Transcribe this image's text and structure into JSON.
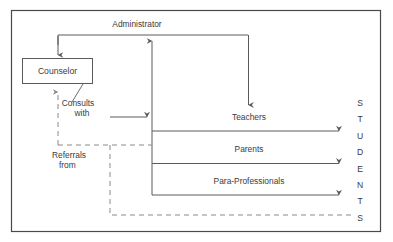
{
  "diagram": {
    "frame": {
      "x": 11,
      "y": 10,
      "width": 370,
      "height": 222,
      "color": "#4a4a4a"
    },
    "colors": {
      "solid_line": "#5a5a5a",
      "dashed_line": "#8a8a8a",
      "text": "#3b3b3b",
      "box_fill": "#ffffff",
      "background": "#ffffff"
    },
    "nodes": [
      {
        "id": "counselor",
        "label": "Counselor",
        "shape": "rectangle",
        "x": 22,
        "y": 58,
        "width": 71,
        "height": 26
      },
      {
        "id": "administrator",
        "label": "Administrator",
        "shape": "text",
        "x": 137,
        "y": 27
      },
      {
        "id": "teachers",
        "label": "Teachers",
        "shape": "text",
        "x": 249,
        "y": 120
      },
      {
        "id": "parents",
        "label": "Parents",
        "shape": "text",
        "x": 249,
        "y": 152
      },
      {
        "id": "para_professionals",
        "label": "Para-Professionals",
        "shape": "text",
        "x": 249,
        "y": 184
      },
      {
        "id": "students",
        "label": "STUDENTS",
        "shape": "vertical-text",
        "letters": [
          "S",
          "T",
          "U",
          "D",
          "E",
          "N",
          "T",
          "S"
        ],
        "x": 360,
        "y_start": 106,
        "y_step": 16.4
      }
    ],
    "edge_labels": [
      {
        "id": "consults-with",
        "line1": "Consults",
        "line2": "with",
        "x": 78,
        "y1": 106,
        "y2": 116
      },
      {
        "id": "referrals-from",
        "line1": "Referrals",
        "line2": "from",
        "x": 52,
        "y1": 158,
        "y2": 168
      }
    ],
    "edges": [
      {
        "id": "administrator-to-counselor",
        "style": "solid",
        "arrow": "end"
      },
      {
        "id": "counselor-to-administrator-trunk",
        "style": "solid",
        "arrow": "end"
      },
      {
        "id": "administrator-to-teachers",
        "style": "solid",
        "arrow": "end"
      },
      {
        "id": "consults-with-to-trunk",
        "style": "solid",
        "arrow": "end"
      },
      {
        "id": "teachers-to-students",
        "style": "solid",
        "arrow": "end"
      },
      {
        "id": "parents-to-students",
        "style": "solid",
        "arrow": "end"
      },
      {
        "id": "para-professionals-to-students",
        "style": "solid",
        "arrow": "end"
      },
      {
        "id": "referrals-from-counselor-vertical",
        "style": "dashed",
        "arrow": "end"
      },
      {
        "id": "referrals-from-branch",
        "style": "dashed",
        "arrow": "none"
      },
      {
        "id": "referrals-from-students",
        "style": "dashed",
        "arrow": "none"
      }
    ]
  }
}
